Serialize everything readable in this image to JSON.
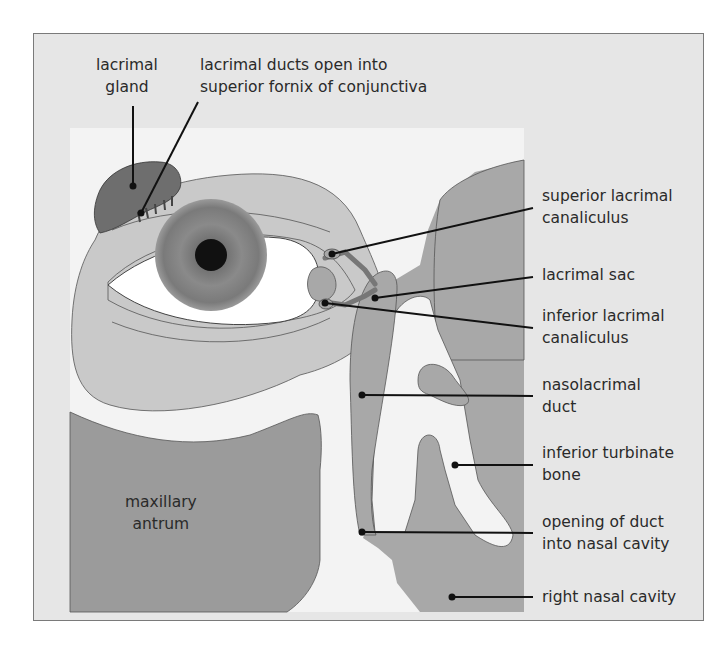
{
  "figure": {
    "type": "anatomical diagram",
    "colors": {
      "frame_bg": "#e6e6e6",
      "panel_bg": "#f3f3f3",
      "light_tissue": "#c9c9c9",
      "mid_tissue": "#a6a6a6",
      "dark_tissue": "#8f8f8f",
      "gland": "#6e6e6e",
      "iris": "#777777",
      "pupil": "#111111",
      "leader_line": "#111111"
    }
  },
  "labels": {
    "lacrimal_gland": {
      "line1": "lacrimal",
      "line2": "gland"
    },
    "lacrimal_ducts": {
      "line1": "lacrimal ducts open into",
      "line2": "superior fornix of conjunctiva"
    },
    "superior_canaliculus": {
      "line1": "superior lacrimal",
      "line2": "canaliculus"
    },
    "lacrimal_sac": {
      "line1": "lacrimal sac"
    },
    "inferior_canaliculus": {
      "line1": "inferior lacrimal",
      "line2": "canaliculus"
    },
    "nasolacrimal_duct": {
      "line1": "nasolacrimal",
      "line2": "duct"
    },
    "inferior_turbinate": {
      "line1": "inferior turbinate",
      "line2": "bone"
    },
    "opening_of_duct": {
      "line1": "opening of duct",
      "line2": "into nasal cavity"
    },
    "right_nasal_cavity": {
      "line1": "right nasal cavity"
    },
    "maxillary_antrum": {
      "line1": "maxillary",
      "line2": "antrum"
    }
  }
}
